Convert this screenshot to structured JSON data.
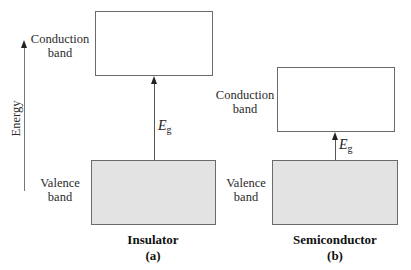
{
  "axis": {
    "label": "Energy",
    "direction": "up"
  },
  "panels": [
    {
      "id": "a",
      "title": "Insulator",
      "tag": "(a)",
      "conduction_label_line1": "Conduction",
      "conduction_label_line2": "band",
      "valence_label_line1": "Valence",
      "valence_label_line2": "band",
      "gap_symbol": "E",
      "gap_subscript": "g",
      "gap_size": "large"
    },
    {
      "id": "b",
      "title": "Semiconductor",
      "tag": "(b)",
      "conduction_label_line1": "Conduction",
      "conduction_label_line2": "band",
      "valence_label_line1": "Valence",
      "valence_label_line2": "band",
      "gap_symbol": "E",
      "gap_subscript": "g",
      "gap_size": "small"
    }
  ],
  "colors": {
    "valence_fill": "#e3e3e3",
    "conduction_fill": "#ffffff",
    "border": "#6a6a6a",
    "arrow": "#222222"
  }
}
